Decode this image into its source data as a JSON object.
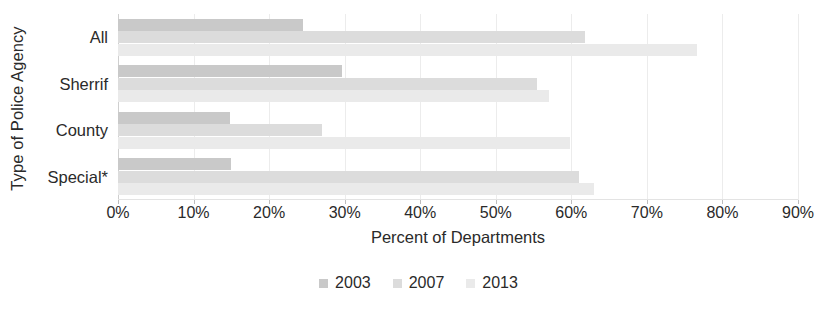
{
  "chart_data": {
    "type": "bar",
    "orientation": "horizontal",
    "title": "",
    "xlabel": "Percent of Departments",
    "ylabel": "Type of Police Agency",
    "categories": [
      "All",
      "Sherrif",
      "County",
      "Special*"
    ],
    "series": [
      {
        "name": "2003",
        "color": "#c9c9c9",
        "values": [
          24.5,
          29.6,
          14.8,
          15.0
        ]
      },
      {
        "name": "2007",
        "color": "#dcdcdc",
        "values": [
          61.8,
          55.5,
          27.0,
          61.0
        ]
      },
      {
        "name": "2013",
        "color": "#eaeaea",
        "values": [
          76.6,
          57.0,
          59.8,
          63.0
        ]
      }
    ],
    "xlim": [
      0,
      90
    ],
    "xticks": [
      0,
      10,
      20,
      30,
      40,
      50,
      60,
      70,
      80,
      90
    ],
    "xticklabels": [
      "0%",
      "10%",
      "20%",
      "30%",
      "40%",
      "50%",
      "60%",
      "70%",
      "80%",
      "90%"
    ],
    "grid": "vertical",
    "legend_position": "bottom",
    "footnote": "",
    "gridline_color": "#ececec",
    "text_color": "#2a2a2a"
  }
}
